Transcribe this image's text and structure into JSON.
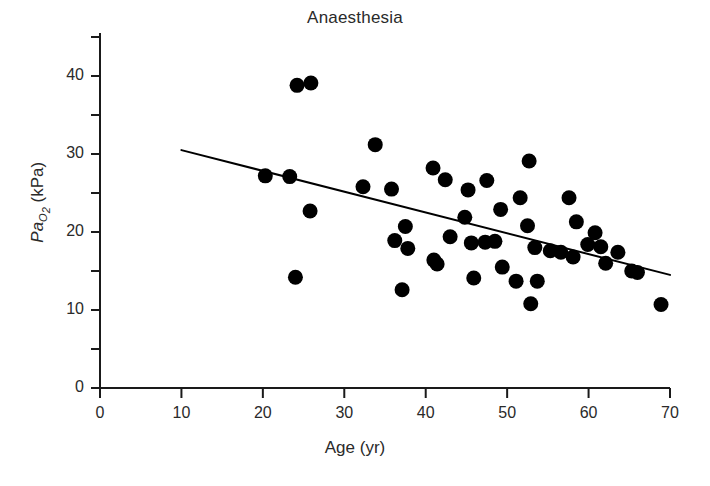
{
  "chart_data": {
    "type": "scatter",
    "title": "Anaesthesia",
    "xlabel": "Age (yr)",
    "ylabel": "PaO2 (kPa)",
    "ylabel_parts": {
      "prefix": "Pa",
      "sub": "O",
      "sub2": "2",
      "units": " (kPa)"
    },
    "xlim": [
      0,
      70
    ],
    "ylim": [
      0,
      45
    ],
    "grid": false,
    "legend": "none",
    "x_ticks": [
      0,
      10,
      20,
      30,
      40,
      50,
      60,
      70
    ],
    "x_tick_labels": [
      "0",
      "10",
      "20",
      "30",
      "40",
      "50",
      "60",
      "70"
    ],
    "x_minor_ticks": [],
    "y_ticks": [
      0,
      5,
      10,
      15,
      20,
      25,
      30,
      35,
      40,
      45
    ],
    "y_tick_labels": [
      "0",
      "",
      "10",
      "",
      "20",
      "",
      "30",
      "",
      "40",
      ""
    ],
    "marker": {
      "shape": "circle",
      "color": "#000000",
      "size_px": 15
    },
    "points": [
      {
        "x": 20.3,
        "y": 27.2
      },
      {
        "x": 23.3,
        "y": 27.1
      },
      {
        "x": 24.2,
        "y": 38.8
      },
      {
        "x": 25.9,
        "y": 39.1
      },
      {
        "x": 24.0,
        "y": 14.2
      },
      {
        "x": 25.8,
        "y": 22.7
      },
      {
        "x": 32.3,
        "y": 25.8
      },
      {
        "x": 33.8,
        "y": 31.2
      },
      {
        "x": 35.8,
        "y": 25.5
      },
      {
        "x": 36.2,
        "y": 18.9
      },
      {
        "x": 37.1,
        "y": 12.6
      },
      {
        "x": 37.5,
        "y": 20.7
      },
      {
        "x": 37.8,
        "y": 17.9
      },
      {
        "x": 40.9,
        "y": 28.2
      },
      {
        "x": 41.0,
        "y": 16.4
      },
      {
        "x": 41.4,
        "y": 15.9
      },
      {
        "x": 42.4,
        "y": 26.7
      },
      {
        "x": 43.0,
        "y": 19.4
      },
      {
        "x": 44.8,
        "y": 21.9
      },
      {
        "x": 45.2,
        "y": 25.4
      },
      {
        "x": 45.6,
        "y": 18.6
      },
      {
        "x": 45.9,
        "y": 14.1
      },
      {
        "x": 47.3,
        "y": 18.7
      },
      {
        "x": 47.5,
        "y": 26.6
      },
      {
        "x": 48.5,
        "y": 18.8
      },
      {
        "x": 49.2,
        "y": 22.9
      },
      {
        "x": 49.4,
        "y": 15.5
      },
      {
        "x": 51.1,
        "y": 13.7
      },
      {
        "x": 51.6,
        "y": 24.4
      },
      {
        "x": 52.5,
        "y": 20.8
      },
      {
        "x": 52.7,
        "y": 29.1
      },
      {
        "x": 52.9,
        "y": 10.8
      },
      {
        "x": 53.4,
        "y": 18.0
      },
      {
        "x": 53.7,
        "y": 13.7
      },
      {
        "x": 55.3,
        "y": 17.6
      },
      {
        "x": 56.6,
        "y": 17.4
      },
      {
        "x": 57.6,
        "y": 24.4
      },
      {
        "x": 58.1,
        "y": 16.8
      },
      {
        "x": 58.5,
        "y": 21.3
      },
      {
        "x": 59.9,
        "y": 18.4
      },
      {
        "x": 60.8,
        "y": 19.9
      },
      {
        "x": 61.5,
        "y": 18.1
      },
      {
        "x": 62.1,
        "y": 16.0
      },
      {
        "x": 63.6,
        "y": 17.4
      },
      {
        "x": 65.3,
        "y": 15.0
      },
      {
        "x": 66.0,
        "y": 14.8
      },
      {
        "x": 68.9,
        "y": 10.7
      }
    ],
    "trendline": {
      "label": "regression-line",
      "x_start": 10.0,
      "y_start": 30.5,
      "x_end": 70.0,
      "y_end": 14.5,
      "color": "#000000",
      "width_px": 2
    }
  }
}
